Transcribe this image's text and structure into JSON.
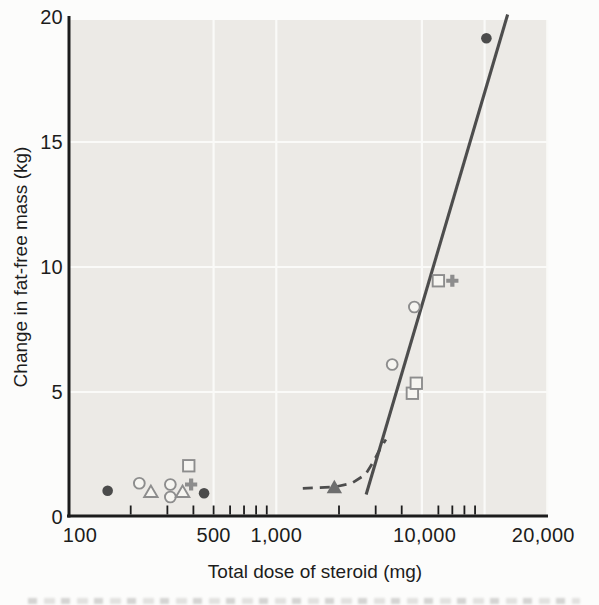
{
  "figure": {
    "colors": {
      "page_bg": "#fcfcfb",
      "plot_bg": "#ECEAE6",
      "grid": "#FAFAF8",
      "axis": "#1c1c1c",
      "text": "#1c1c1c",
      "trend_line": "#4d4d4d",
      "filled_marker": "#4b4b4b",
      "filled_triangle": "#6e6e6e",
      "open_marker_stroke": "#8d8d8d",
      "open_marker_fill": "#F6F5F1",
      "plus_marker": "#8d8d8d"
    }
  },
  "chart_data": {
    "type": "scatter",
    "title": "",
    "xlabel": "Total dose of steroid (mg)",
    "ylabel": "Change in fat-free mass (kg)",
    "x_scale": "log",
    "xlim": [
      100,
      20000
    ],
    "ylim": [
      0,
      20
    ],
    "grid": "on",
    "legend": "none",
    "x_tick_labels": [
      {
        "value": 100,
        "label": "100"
      },
      {
        "value": 500,
        "label": "500"
      },
      {
        "value": 1000,
        "label": "1,000"
      },
      {
        "value": 10000,
        "label": "10,000"
      },
      {
        "value": 20000,
        "label": "20,000"
      }
    ],
    "x_minor_ticks": [
      200,
      300,
      400,
      500,
      600,
      700,
      800,
      900,
      2000,
      3000,
      4000,
      6000,
      7000,
      8000,
      9000
    ],
    "y_tick_labels": [
      {
        "value": 0,
        "label": "0"
      },
      {
        "value": 5,
        "label": "5"
      },
      {
        "value": 10,
        "label": "10"
      },
      {
        "value": 15,
        "label": "15"
      },
      {
        "value": 20,
        "label": "20"
      }
    ],
    "x_gridlines": [
      500,
      1000,
      5000,
      10000,
      20000
    ],
    "y_gridlines": [
      5,
      10,
      15
    ],
    "points": [
      {
        "dose": 155,
        "kg": 1.05,
        "marker": "filled-circle"
      },
      {
        "dose": 220,
        "kg": 1.35,
        "marker": "open-circle"
      },
      {
        "dose": 250,
        "kg": 1.0,
        "marker": "open-triangle"
      },
      {
        "dose": 310,
        "kg": 1.3,
        "marker": "open-circle"
      },
      {
        "dose": 310,
        "kg": 0.8,
        "marker": "open-circle"
      },
      {
        "dose": 355,
        "kg": 1.0,
        "marker": "open-triangle"
      },
      {
        "dose": 390,
        "kg": 1.3,
        "marker": "plus"
      },
      {
        "dose": 380,
        "kg": 2.05,
        "marker": "open-square"
      },
      {
        "dose": 450,
        "kg": 0.95,
        "marker": "filled-circle"
      },
      {
        "dose": 1900,
        "kg": 1.2,
        "marker": "filled-triangle"
      },
      {
        "dose": 3600,
        "kg": 6.1,
        "marker": "open-circle"
      },
      {
        "dose": 4500,
        "kg": 4.95,
        "marker": "open-square"
      },
      {
        "dose": 4700,
        "kg": 5.35,
        "marker": "open-square"
      },
      {
        "dose": 4600,
        "kg": 8.4,
        "marker": "open-circle"
      },
      {
        "dose": 6000,
        "kg": 9.45,
        "marker": "open-square"
      },
      {
        "dose": 7000,
        "kg": 9.45,
        "marker": "plus"
      },
      {
        "dose": 10200,
        "kg": 19.15,
        "marker": "filled-circle"
      }
    ],
    "solid_line": {
      "from_dose": 2700,
      "from_kg": 0.9,
      "to_dose": 12900,
      "to_kg": 20.1
    },
    "dashed_curve": [
      [
        1340,
        1.15
      ],
      [
        1900,
        1.2
      ],
      [
        2300,
        1.35
      ],
      [
        2680,
        1.7
      ],
      [
        2920,
        2.2
      ],
      [
        3140,
        2.7
      ],
      [
        3360,
        3.1
      ]
    ]
  }
}
